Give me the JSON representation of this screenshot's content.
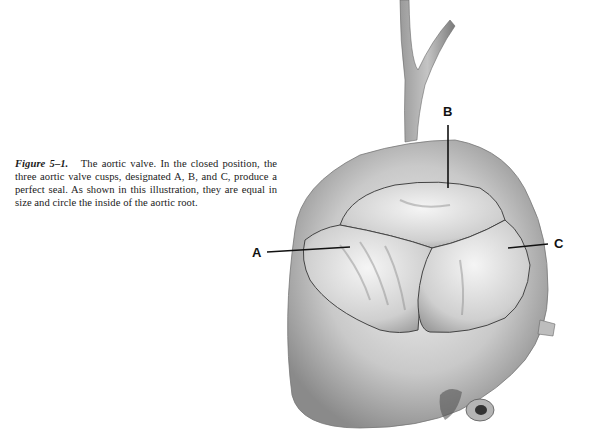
{
  "figure": {
    "label": "Figure 5–1.",
    "caption": "The aortic valve. In the closed position, the three aortic valve cusps, designated A, B, and C, produce a perfect seal. As shown in this illustration, they are equal in size and circle the inside of the aortic root.",
    "illustration": "aortic-valve-drawing",
    "labels": [
      {
        "id": "A",
        "text": "A"
      },
      {
        "id": "B",
        "text": "B"
      },
      {
        "id": "C",
        "text": "C"
      }
    ]
  }
}
